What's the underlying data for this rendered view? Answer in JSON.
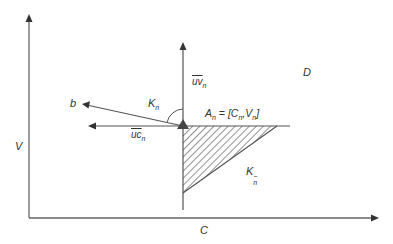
{
  "diagram": {
    "axes": {
      "x_label": "C",
      "y_label": "V"
    },
    "point": {
      "name": "A",
      "subscript": "n",
      "formula_lhs": "A",
      "formula_lhs_sub": "n",
      "formula_eq": " = [C",
      "formula_c_sub": "n",
      "formula_mid": ",V",
      "formula_v_sub": "n",
      "formula_end": "]"
    },
    "vectors": {
      "uv": {
        "base": "uv",
        "sub": "n"
      },
      "uc": {
        "base": "uc",
        "sub": "n"
      },
      "b": {
        "label": "b"
      }
    },
    "cones": {
      "kn": {
        "base": "K",
        "sub": "n"
      },
      "kn_minus": {
        "base": "K",
        "sub": "n",
        "sup": "−"
      }
    },
    "region": {
      "label": "D"
    },
    "colors": {
      "line": "#555555",
      "arrow": "#333333",
      "hatch": "#555555",
      "text": "#333333"
    }
  }
}
